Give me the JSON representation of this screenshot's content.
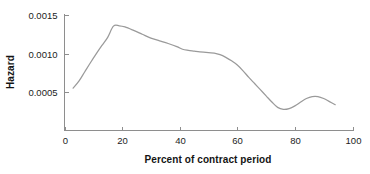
{
  "chart_data": {
    "type": "line",
    "title": "",
    "xlabel": "Percent of contract period",
    "ylabel": "Hazard",
    "xlim": [
      0,
      100
    ],
    "ylim": [
      0,
      0.0015
    ],
    "grid": false,
    "legend": "none",
    "x_ticks": [
      "0",
      "20",
      "40",
      "60",
      "80",
      "100"
    ],
    "x_tick_values": [
      0,
      20,
      40,
      60,
      80,
      100
    ],
    "y_ticks": [
      "0.0005",
      "0.0010",
      "0.0015"
    ],
    "y_tick_values": [
      0.0005,
      0.001,
      0.0015
    ],
    "series": [
      {
        "name": "Hazard",
        "color": "#9a9a9a",
        "x": [
          3,
          5,
          7,
          9,
          11,
          13,
          15,
          17,
          19,
          21,
          24,
          27,
          30,
          33,
          36,
          39,
          41,
          43,
          45,
          47,
          50,
          52,
          54,
          56,
          58,
          60,
          62,
          64,
          66,
          68,
          70,
          72,
          74,
          76,
          78,
          80,
          82,
          84,
          86,
          88,
          90,
          92,
          94
        ],
        "y": [
          0.00055,
          0.00064,
          0.00076,
          0.00088,
          0.000995,
          0.001105,
          0.00121,
          0.001355,
          0.00136,
          0.001345,
          0.0013,
          0.00125,
          0.0012,
          0.001165,
          0.00113,
          0.00109,
          0.001055,
          0.00104,
          0.00103,
          0.00102,
          0.00101,
          0.001005,
          0.000985,
          0.00095,
          0.000905,
          0.00085,
          0.000775,
          0.00069,
          0.00061,
          0.00053,
          0.00045,
          0.00037,
          0.0003,
          0.000275,
          0.000285,
          0.00032,
          0.00037,
          0.000415,
          0.00044,
          0.00044,
          0.000415,
          0.000375,
          0.000335
        ]
      }
    ]
  },
  "axes": {
    "x_title": "Percent of contract period",
    "y_title": "Hazard"
  }
}
